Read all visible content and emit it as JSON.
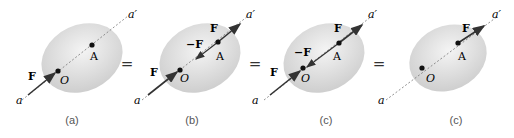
{
  "figure": {
    "panels": [
      {
        "id": "a",
        "caption": "(a)",
        "label_a": "a",
        "label_a_prime": "a′",
        "label_O": "O",
        "label_A": "A",
        "force_at_O": "F"
      },
      {
        "id": "b",
        "caption": "(b)",
        "label_a": "a",
        "label_a_prime": "a′",
        "label_O": "O",
        "label_A": "A",
        "force_at_O": "F",
        "force_at_A": "F",
        "neg_force_at_A": "−F"
      },
      {
        "id": "c1",
        "caption": "(c)",
        "label_a": "a",
        "label_a_prime": "a′",
        "label_O": "O",
        "label_A": "A",
        "force_at_O": "F",
        "force_at_A": "F",
        "neg_force_mid": "−F"
      },
      {
        "id": "c2",
        "caption": "(c)",
        "label_a": "a",
        "label_a_prime": "a′",
        "label_O": "O",
        "label_A": "A",
        "force_at_A": "F"
      }
    ],
    "equals": [
      "=",
      "=",
      "="
    ],
    "colors": {
      "body_fill": "#d9d9d9",
      "arrow": "#333333",
      "line": "#777777",
      "point": "#111111"
    }
  }
}
